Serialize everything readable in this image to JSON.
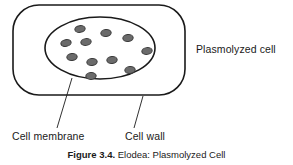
{
  "figure": {
    "caption_number": "Figure 3.4.",
    "caption_title": "Elodea: Plasmolyzed Cell",
    "background_color": "#ffffff",
    "stroke_color": "#1a1a1a",
    "chloroplast_fill": "#6b6b6b",
    "chloroplast_stroke": "#3a3a3a"
  },
  "labels": {
    "plasmolyzed_cell": "Plasmolyzed cell",
    "cell_membrane": "Cell membrane",
    "cell_wall": "Cell wall"
  },
  "diagram": {
    "cell_wall_shape": {
      "type": "rounded-rectangle",
      "x": 13,
      "y": 5,
      "width": 172,
      "height": 90,
      "rx": 26,
      "ry": 26,
      "stroke_width": 1.6
    },
    "cell_membrane_shape": {
      "type": "ellipse",
      "cx": 100,
      "cy": 48,
      "rx": 55,
      "ry": 31,
      "stroke_width": 1.6
    },
    "chloroplasts": [
      {
        "cx": 80,
        "cy": 29,
        "rx": 5.2,
        "ry": 3.4,
        "rot": -8
      },
      {
        "cx": 106,
        "cy": 33,
        "rx": 5.2,
        "ry": 3.4,
        "rot": -5
      },
      {
        "cx": 128,
        "cy": 38,
        "rx": 5.2,
        "ry": 3.4,
        "rot": -6
      },
      {
        "cx": 66,
        "cy": 43,
        "rx": 5.2,
        "ry": 3.4,
        "rot": -10
      },
      {
        "cx": 86,
        "cy": 42,
        "rx": 5.2,
        "ry": 3.4,
        "rot": -7
      },
      {
        "cx": 147,
        "cy": 51,
        "rx": 5.2,
        "ry": 3.4,
        "rot": -7
      },
      {
        "cx": 72,
        "cy": 57,
        "rx": 5.2,
        "ry": 3.4,
        "rot": -6
      },
      {
        "cx": 92,
        "cy": 62,
        "rx": 5.2,
        "ry": 3.4,
        "rot": -5
      },
      {
        "cx": 112,
        "cy": 60,
        "rx": 5.2,
        "ry": 3.4,
        "rot": -6
      },
      {
        "cx": 130,
        "cy": 70,
        "rx": 5.2,
        "ry": 3.4,
        "rot": -5
      },
      {
        "cx": 91,
        "cy": 76,
        "rx": 5.2,
        "ry": 3.4,
        "rot": -4
      }
    ],
    "leader_lines": [
      {
        "name": "cell-membrane-leader",
        "x1": 72,
        "y1": 78,
        "x2": 57,
        "y2": 128
      },
      {
        "name": "cell-wall-leader",
        "x1": 143,
        "y1": 96,
        "x2": 134,
        "y2": 128
      }
    ]
  }
}
